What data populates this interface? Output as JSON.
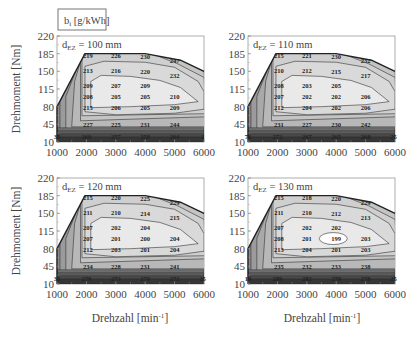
{
  "legend_box": {
    "label": "b_i [g/kWh]",
    "main": "b",
    "sub": "i",
    "unit": "[g/kWh]"
  },
  "axes": {
    "ylabel": "Drehmoment [Nm]",
    "xlabel": "Drehzahl [min⁻¹]",
    "xlabel_main": "Drehzahl [min",
    "xlabel_sup": "-1",
    "xlabel_end": "]",
    "yticks": [
      "220",
      "185",
      "150",
      "115",
      "80",
      "45",
      "10"
    ],
    "xticks": [
      "1000",
      "2000",
      "3000",
      "4000",
      "5000",
      "6000"
    ]
  },
  "panels": [
    {
      "id": "p100",
      "title_main": "d",
      "title_sub": "EZ",
      "title_val": "= 100 mm",
      "labels": [
        {
          "t": "219",
          "x": 2050,
          "y": 180
        },
        {
          "t": "226",
          "x": 3000,
          "y": 180
        },
        {
          "t": "230",
          "x": 4000,
          "y": 178
        },
        {
          "t": "247",
          "x": 5000,
          "y": 170
        },
        {
          "t": "213",
          "x": 2050,
          "y": 150
        },
        {
          "t": "216",
          "x": 3000,
          "y": 150
        },
        {
          "t": "220",
          "x": 4000,
          "y": 149
        },
        {
          "t": "232",
          "x": 5000,
          "y": 140
        },
        {
          "t": "209",
          "x": 2050,
          "y": 121
        },
        {
          "t": "207",
          "x": 3000,
          "y": 121
        },
        {
          "t": "209",
          "x": 4000,
          "y": 121
        },
        {
          "t": "208",
          "x": 2050,
          "y": 99
        },
        {
          "t": "205",
          "x": 3000,
          "y": 99
        },
        {
          "t": "205",
          "x": 4000,
          "y": 99
        },
        {
          "t": "210",
          "x": 5000,
          "y": 99
        },
        {
          "t": "215",
          "x": 2050,
          "y": 77
        },
        {
          "t": "206",
          "x": 3000,
          "y": 77
        },
        {
          "t": "205",
          "x": 4000,
          "y": 78
        },
        {
          "t": "209",
          "x": 5000,
          "y": 77
        },
        {
          "t": "227",
          "x": 2050,
          "y": 44
        },
        {
          "t": "225",
          "x": 3000,
          "y": 44
        },
        {
          "t": "231",
          "x": 4000,
          "y": 44
        },
        {
          "t": "244",
          "x": 5000,
          "y": 44
        },
        {
          "t": "35",
          "x": 1000,
          "y": 19
        },
        {
          "t": "260",
          "x": 2000,
          "y": 19
        },
        {
          "t": "257",
          "x": 3000,
          "y": 19
        },
        {
          "t": "258",
          "x": 4000,
          "y": 19
        },
        {
          "t": "264",
          "x": 5000,
          "y": 19
        },
        {
          "t": "2",
          "x": 5950,
          "y": 19
        }
      ],
      "min_island": false
    },
    {
      "id": "p110",
      "title_main": "d",
      "title_sub": "EZ",
      "title_val": "= 110 mm",
      "labels": [
        {
          "t": "215",
          "x": 2050,
          "y": 180
        },
        {
          "t": "221",
          "x": 3000,
          "y": 180
        },
        {
          "t": "230",
          "x": 4000,
          "y": 178
        },
        {
          "t": "232",
          "x": 5000,
          "y": 170
        },
        {
          "t": "210",
          "x": 2050,
          "y": 150
        },
        {
          "t": "212",
          "x": 3000,
          "y": 150
        },
        {
          "t": "215",
          "x": 4000,
          "y": 149
        },
        {
          "t": "217",
          "x": 5000,
          "y": 140
        },
        {
          "t": "208",
          "x": 2050,
          "y": 121
        },
        {
          "t": "203",
          "x": 3000,
          "y": 121
        },
        {
          "t": "205",
          "x": 4000,
          "y": 121
        },
        {
          "t": "207",
          "x": 2050,
          "y": 99
        },
        {
          "t": "202",
          "x": 3000,
          "y": 99
        },
        {
          "t": "202",
          "x": 4000,
          "y": 99
        },
        {
          "t": "206",
          "x": 5000,
          "y": 99
        },
        {
          "t": "212",
          "x": 2050,
          "y": 77
        },
        {
          "t": "204",
          "x": 3000,
          "y": 78
        },
        {
          "t": "202",
          "x": 4000,
          "y": 78
        },
        {
          "t": "206",
          "x": 5000,
          "y": 77
        },
        {
          "t": "231",
          "x": 2050,
          "y": 44
        },
        {
          "t": "227",
          "x": 3000,
          "y": 44
        },
        {
          "t": "230",
          "x": 4000,
          "y": 44
        },
        {
          "t": "242",
          "x": 5000,
          "y": 44
        },
        {
          "t": "76",
          "x": 1000,
          "y": 19
        },
        {
          "t": "272",
          "x": 2000,
          "y": 19
        },
        {
          "t": "267",
          "x": 3000,
          "y": 19
        },
        {
          "t": "265",
          "x": 4000,
          "y": 19
        },
        {
          "t": "268",
          "x": 5000,
          "y": 19
        },
        {
          "t": "25",
          "x": 5950,
          "y": 19
        }
      ],
      "min_island": false
    },
    {
      "id": "p120",
      "title_main": "d",
      "title_sub": "EZ",
      "title_val": "= 120 mm",
      "labels": [
        {
          "t": "215",
          "x": 2050,
          "y": 180
        },
        {
          "t": "220",
          "x": 3000,
          "y": 180
        },
        {
          "t": "225",
          "x": 4000,
          "y": 178
        },
        {
          "t": "229",
          "x": 5000,
          "y": 170
        },
        {
          "t": "211",
          "x": 2050,
          "y": 150
        },
        {
          "t": "210",
          "x": 3000,
          "y": 150
        },
        {
          "t": "214",
          "x": 4000,
          "y": 149
        },
        {
          "t": "215",
          "x": 5000,
          "y": 140
        },
        {
          "t": "207",
          "x": 2050,
          "y": 121
        },
        {
          "t": "202",
          "x": 3000,
          "y": 121
        },
        {
          "t": "204",
          "x": 4000,
          "y": 121
        },
        {
          "t": "207",
          "x": 2050,
          "y": 99
        },
        {
          "t": "201",
          "x": 3000,
          "y": 99
        },
        {
          "t": "200",
          "x": 4000,
          "y": 99
        },
        {
          "t": "204",
          "x": 5000,
          "y": 99
        },
        {
          "t": "212",
          "x": 2050,
          "y": 77
        },
        {
          "t": "203",
          "x": 3000,
          "y": 78
        },
        {
          "t": "201",
          "x": 4000,
          "y": 78
        },
        {
          "t": "204",
          "x": 5000,
          "y": 77
        },
        {
          "t": "234",
          "x": 2050,
          "y": 44
        },
        {
          "t": "228",
          "x": 3000,
          "y": 44
        },
        {
          "t": "231",
          "x": 4000,
          "y": 44
        },
        {
          "t": "241",
          "x": 5000,
          "y": 44
        },
        {
          "t": "33",
          "x": 1000,
          "y": 19
        },
        {
          "t": "279",
          "x": 2000,
          "y": 19
        },
        {
          "t": "273",
          "x": 3000,
          "y": 19
        },
        {
          "t": "270",
          "x": 4000,
          "y": 19
        },
        {
          "t": "272",
          "x": 5000,
          "y": 19
        },
        {
          "t": "25",
          "x": 5950,
          "y": 19
        }
      ],
      "min_island": false
    },
    {
      "id": "p130",
      "title_main": "d",
      "title_sub": "EZ",
      "title_val": "= 130 mm",
      "labels": [
        {
          "t": "215",
          "x": 2050,
          "y": 180
        },
        {
          "t": "218",
          "x": 3000,
          "y": 180
        },
        {
          "t": "220",
          "x": 4000,
          "y": 178
        },
        {
          "t": "229",
          "x": 5000,
          "y": 170
        },
        {
          "t": "211",
          "x": 2050,
          "y": 150
        },
        {
          "t": "210",
          "x": 3000,
          "y": 150
        },
        {
          "t": "212",
          "x": 4000,
          "y": 149
        },
        {
          "t": "213",
          "x": 5000,
          "y": 140
        },
        {
          "t": "207",
          "x": 2050,
          "y": 121
        },
        {
          "t": "202",
          "x": 3000,
          "y": 121
        },
        {
          "t": "202",
          "x": 4000,
          "y": 121
        },
        {
          "t": "208",
          "x": 2050,
          "y": 99
        },
        {
          "t": "201",
          "x": 3000,
          "y": 99
        },
        {
          "t": "199",
          "x": 4000,
          "y": 99
        },
        {
          "t": "203",
          "x": 5000,
          "y": 99
        },
        {
          "t": "213",
          "x": 2050,
          "y": 77
        },
        {
          "t": "204",
          "x": 3000,
          "y": 78
        },
        {
          "t": "201",
          "x": 4000,
          "y": 78
        },
        {
          "t": "203",
          "x": 5000,
          "y": 77
        },
        {
          "t": "235",
          "x": 2050,
          "y": 44
        },
        {
          "t": "232",
          "x": 3000,
          "y": 44
        },
        {
          "t": "233",
          "x": 4000,
          "y": 44
        },
        {
          "t": "238",
          "x": 5000,
          "y": 44
        },
        {
          "t": "14",
          "x": 1000,
          "y": 19
        },
        {
          "t": "289",
          "x": 2000,
          "y": 19
        },
        {
          "t": "282",
          "x": 3000,
          "y": 19
        },
        {
          "t": "278",
          "x": 4000,
          "y": 19
        },
        {
          "t": "278",
          "x": 5000,
          "y": 19
        },
        {
          "t": "25",
          "x": 5950,
          "y": 19
        }
      ],
      "min_island": true
    }
  ],
  "chart_data": [
    {
      "type": "heatmap",
      "title": "d_EZ = 100 mm",
      "xlabel": "Drehzahl [min^-1]",
      "ylabel": "Drehmoment [Nm]",
      "xlim": [
        1000,
        6000
      ],
      "ylim": [
        10,
        220
      ],
      "colorbar_label": "b_i [g/kWh]",
      "min_value": 205,
      "contour_labels": [
        219,
        226,
        230,
        247,
        213,
        216,
        220,
        232,
        209,
        207,
        209,
        208,
        205,
        205,
        210,
        215,
        206,
        205,
        209,
        227,
        225,
        231,
        244,
        260,
        257,
        258,
        264
      ]
    },
    {
      "type": "heatmap",
      "title": "d_EZ = 110 mm",
      "xlabel": "Drehzahl [min^-1]",
      "ylabel": "Drehmoment [Nm]",
      "xlim": [
        1000,
        6000
      ],
      "ylim": [
        10,
        220
      ],
      "colorbar_label": "b_i [g/kWh]",
      "min_value": 202,
      "contour_labels": [
        215,
        221,
        230,
        232,
        210,
        212,
        215,
        217,
        208,
        203,
        205,
        207,
        202,
        202,
        206,
        212,
        204,
        202,
        206,
        231,
        227,
        230,
        242,
        272,
        267,
        265,
        268
      ]
    },
    {
      "type": "heatmap",
      "title": "d_EZ = 120 mm",
      "xlabel": "Drehzahl [min^-1]",
      "ylabel": "Drehmoment [Nm]",
      "xlim": [
        1000,
        6000
      ],
      "ylim": [
        10,
        220
      ],
      "colorbar_label": "b_i [g/kWh]",
      "min_value": 200,
      "contour_labels": [
        215,
        220,
        225,
        229,
        211,
        210,
        214,
        215,
        207,
        202,
        204,
        207,
        201,
        200,
        204,
        212,
        203,
        201,
        204,
        234,
        228,
        231,
        241,
        279,
        273,
        270,
        272
      ]
    },
    {
      "type": "heatmap",
      "title": "d_EZ = 130 mm",
      "xlabel": "Drehzahl [min^-1]",
      "ylabel": "Drehmoment [Nm]",
      "xlim": [
        1000,
        6000
      ],
      "ylim": [
        10,
        220
      ],
      "colorbar_label": "b_i [g/kWh]",
      "min_value": 199,
      "contour_labels": [
        215,
        218,
        220,
        229,
        211,
        210,
        212,
        213,
        207,
        202,
        202,
        208,
        201,
        199,
        203,
        213,
        204,
        201,
        203,
        235,
        232,
        233,
        238,
        289,
        282,
        278,
        278
      ]
    }
  ]
}
